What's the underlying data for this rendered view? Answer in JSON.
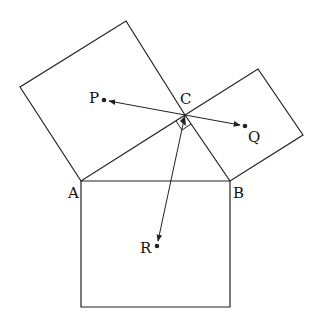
{
  "diagram": {
    "type": "geometry",
    "labels": {
      "A": "A",
      "B": "B",
      "C": "C",
      "P": "P",
      "Q": "Q",
      "R": "R"
    },
    "points": {
      "A": [
        81,
        181
      ],
      "B": [
        230,
        181
      ],
      "C": [
        185,
        115
      ],
      "P": [
        104,
        100
      ],
      "Q": [
        245,
        126
      ],
      "R": [
        157,
        246
      ]
    },
    "colors": {
      "stroke": "#222222",
      "background": "#ffffff"
    }
  }
}
